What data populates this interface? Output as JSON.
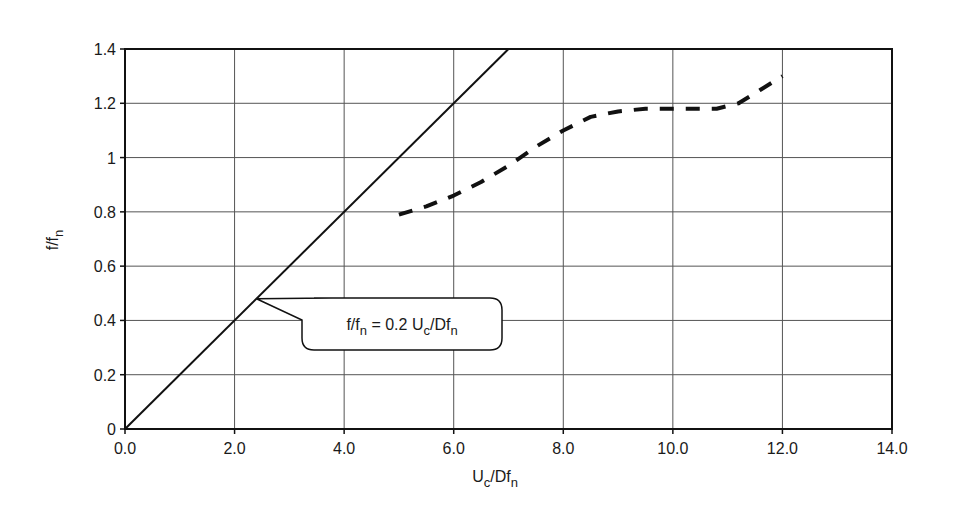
{
  "chart_data": {
    "type": "line",
    "title": "",
    "xlabel": "Uc/Dfn",
    "xlabel_main": "U",
    "xlabel_sub1": "c",
    "xlabel_mid": "/Df",
    "xlabel_sub2": "n",
    "ylabel": "f/fn",
    "ylabel_main": "f/f",
    "ylabel_sub": "n",
    "xlim": [
      0,
      14
    ],
    "ylim": [
      0,
      1.4
    ],
    "grid": true,
    "legend": null,
    "x_ticks": [
      0,
      2,
      4,
      6,
      8,
      10,
      12,
      14
    ],
    "x_tick_labels": [
      "0.0",
      "2.0",
      "4.0",
      "6.0",
      "8.0",
      "10.0",
      "12.0",
      "14.0"
    ],
    "y_ticks": [
      0,
      0.2,
      0.4,
      0.6,
      0.8,
      1.0,
      1.2,
      1.4
    ],
    "y_tick_labels": [
      "0",
      "0.2",
      "0.4",
      "0.6",
      "0.8",
      "1",
      "1.2",
      "1.4"
    ],
    "series": [
      {
        "name": "f/fn = 0.2 Uc/Dfn",
        "style": "solid",
        "x": [
          0,
          7.0
        ],
        "y": [
          0,
          1.4
        ]
      },
      {
        "name": "measured response",
        "style": "dashed",
        "x": [
          5.0,
          5.5,
          6.0,
          6.5,
          7.0,
          7.5,
          8.0,
          8.5,
          9.0,
          9.5,
          10.0,
          10.5,
          10.8,
          11.2,
          11.6,
          12.0
        ],
        "y": [
          0.79,
          0.82,
          0.86,
          0.91,
          0.97,
          1.04,
          1.1,
          1.15,
          1.17,
          1.18,
          1.18,
          1.18,
          1.18,
          1.2,
          1.25,
          1.3
        ]
      }
    ],
    "annotations": [
      {
        "text": "f/fn = 0.2 Uc/Dfn",
        "parts": {
          "a": "f/f",
          "a_sub": "n",
          "b": " = 0.2 U",
          "b_sub": "c",
          "c": "/Df",
          "c_sub": "n"
        },
        "points_to": [
          2.4,
          0.48
        ],
        "box_center": [
          4.6,
          0.38
        ]
      }
    ]
  },
  "colors": {
    "line": "#111111",
    "grid": "#555555",
    "axis": "#111111",
    "background": "#ffffff"
  }
}
